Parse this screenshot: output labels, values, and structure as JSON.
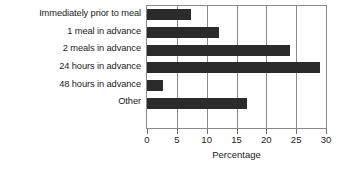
{
  "chart_data": {
    "type": "bar",
    "orientation": "horizontal",
    "title": "",
    "xlabel": "Percentage",
    "ylabel": "",
    "categories": [
      "Immediately prior to meal",
      "1 meal in advance",
      "2 meals in advance",
      "24 hours in advance",
      "48 hours in advance",
      "Other"
    ],
    "values": [
      7.3,
      12.0,
      24.0,
      29.0,
      2.7,
      16.7
    ],
    "xlim": [
      0,
      30
    ],
    "xticks": [
      0,
      5,
      10,
      15,
      20,
      25,
      30
    ],
    "xticklabels": [
      "0",
      "5",
      "10",
      "15",
      "20",
      "25",
      "30"
    ],
    "grid": "vertical",
    "legend": null,
    "bar_color": "#2b2b2b",
    "frame_color": "#8a8a8a",
    "background": "#ffffff"
  }
}
